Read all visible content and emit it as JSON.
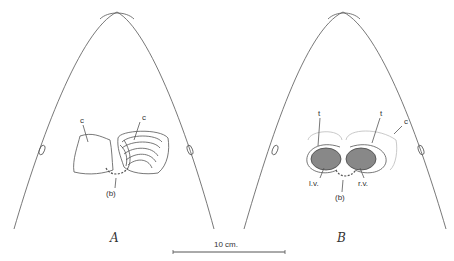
{
  "figure": {
    "panels": [
      {
        "id": "A",
        "label": "A",
        "annotations": {
          "c_left": "c",
          "c_right": "c",
          "b": "(b)"
        }
      },
      {
        "id": "B",
        "label": "B",
        "annotations": {
          "t_left": "t",
          "t_right": "t",
          "c": "c",
          "lv": "l.v.",
          "rv": "r.v.",
          "b": "(b)"
        }
      }
    ],
    "scale_bar": {
      "label": "10 cm."
    }
  }
}
